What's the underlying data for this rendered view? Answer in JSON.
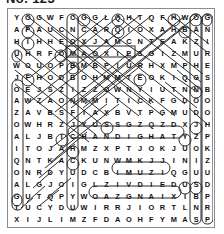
{
  "header": {
    "title": "No. 123"
  },
  "puzzle": {
    "name": "word-search-grid",
    "rows": 18,
    "cols": 18,
    "grid": [
      [
        "Y",
        "O",
        "G",
        "W",
        "F",
        "C",
        "G",
        "G",
        "L",
        "Q",
        "H",
        "T",
        "Q",
        "F",
        "H",
        "W",
        "O",
        "G"
      ],
      [
        "A",
        "P",
        "A",
        "U",
        "C",
        "N",
        "C",
        "A",
        "R",
        "Q",
        "I",
        "O",
        "X",
        "A",
        "H",
        "B",
        "A",
        "N"
      ],
      [
        "H",
        "I",
        "H",
        "H",
        "E",
        "O",
        "X",
        "J",
        "A",
        "M",
        "C",
        "N",
        "T",
        "E",
        "A",
        "K",
        "Z",
        "I"
      ],
      [
        "U",
        "H",
        "R",
        "F",
        "O",
        "M",
        "A",
        "O",
        "X",
        "I",
        "E",
        "S",
        "G",
        "I",
        "Z",
        "M",
        "U",
        "R"
      ],
      [
        "W",
        "O",
        "U",
        "O",
        "P",
        "B",
        "M",
        "B",
        "P",
        "I",
        "U",
        "R",
        "H",
        "X",
        "M",
        "P",
        "H",
        "E"
      ],
      [
        "J",
        "F",
        "H",
        "O",
        "D",
        "B",
        "O",
        "H",
        "M",
        "M",
        "T",
        "E",
        "O",
        "K",
        "I",
        "Q",
        "G",
        "S"
      ],
      [
        "O",
        "E",
        "J",
        "S",
        "Z",
        "I",
        "Z",
        "Z",
        "O",
        "W",
        "N",
        "Y",
        "I",
        "U",
        "T",
        "N",
        "N",
        "B"
      ],
      [
        "A",
        "W",
        "Z",
        "A",
        "O",
        "N",
        "M",
        "M",
        "I",
        "T",
        "I",
        "C",
        "K",
        "F",
        "G",
        "D",
        "O",
        "O"
      ],
      [
        "Z",
        "A",
        "V",
        "B",
        "S",
        "F",
        "I",
        "A",
        "X",
        "B",
        "V",
        "T",
        "P",
        "G",
        "M",
        "U",
        "D",
        "O"
      ],
      [
        "O",
        "W",
        "H",
        "R",
        "Z",
        "J",
        "Y",
        "U",
        "S",
        "S",
        "G",
        "Z",
        "Q",
        "Z",
        "D",
        "X",
        "J",
        "H"
      ],
      [
        "A",
        "L",
        "J",
        "B",
        "I",
        "C",
        "H",
        "A",
        "N",
        "D",
        "I",
        "G",
        "H",
        "A",
        "T",
        "Y",
        "Z",
        "P"
      ],
      [
        "I",
        "T",
        "O",
        "J",
        "A",
        "H",
        "M",
        "Z",
        "X",
        "P",
        "T",
        "J",
        "O",
        "K",
        "J",
        "U",
        "O",
        "K"
      ],
      [
        "Q",
        "N",
        "T",
        "K",
        "A",
        "C",
        "K",
        "U",
        "N",
        "W",
        "M",
        "K",
        "J",
        "J",
        "I",
        "N",
        "I",
        "Z"
      ],
      [
        "O",
        "N",
        "R",
        "D",
        "Y",
        "U",
        "D",
        "C",
        "B",
        "I",
        "M",
        "U",
        "Z",
        "I",
        "Q",
        "G",
        "U",
        "U"
      ],
      [
        "A",
        "L",
        "G",
        "J",
        "O",
        "I",
        "G",
        "L",
        "Z",
        "I",
        "V",
        "D",
        "I",
        "E",
        "D",
        "U",
        "S",
        "D"
      ],
      [
        "G",
        "U",
        "T",
        "Q",
        "P",
        "Y",
        "W",
        "O",
        "A",
        "Z",
        "G",
        "N",
        "A",
        "I",
        "X",
        "I",
        "B",
        "P"
      ],
      [
        "T",
        "U",
        "C",
        "Y",
        "D",
        "U",
        "W",
        "I",
        "R",
        "R",
        "J",
        "I",
        "O",
        "R",
        "T",
        "L",
        "N",
        "R"
      ],
      [
        "X",
        "I",
        "J",
        "L",
        "I",
        "M",
        "Z",
        "F",
        "D",
        "A",
        "O",
        "H",
        "F",
        "Y",
        "M",
        "A",
        "S",
        "P"
      ]
    ],
    "found_words": [
      {
        "text": "CHANDIGHAT",
        "row": 10,
        "col_start": 5,
        "col_end": 14,
        "shape": "capsule-horizontal"
      },
      {
        "text": "IMUZI",
        "row": 13,
        "col_start": 9,
        "col_end": 13,
        "shape": "capsule-horizontal"
      },
      {
        "text": "OAZGNAIX",
        "row": 15,
        "col_start": 7,
        "col_end": 14,
        "shape": "capsule-horizontal"
      },
      {
        "text": "MAOXIE",
        "row": 3,
        "col_start": 5,
        "col_end": 10,
        "shape": "box-horizontal"
      },
      {
        "text": "OAZUHGNODJYOIUSBNS",
        "col": 16,
        "row_start": 0,
        "row_end": 17,
        "shape": "capsule-vertical"
      },
      {
        "text": "GNIRESBOOHPKZUDPRP",
        "col": 17,
        "row_start": 0,
        "row_end": 17,
        "shape": "capsule-vertical"
      },
      {
        "text": "OAZOAIQOAGT",
        "col": 0,
        "row_start": 6,
        "row_end": 16,
        "shape": "capsule-vertical"
      },
      {
        "text": "HOBSANKDYUW",
        "col": 5,
        "row_start": 0,
        "row_end": 16,
        "shape": "capsule-vertical"
      }
    ],
    "circled_letters": [
      {
        "letter": "O",
        "row": 0,
        "col": 1
      },
      {
        "letter": "G",
        "row": 0,
        "col": 6
      },
      {
        "letter": "Q",
        "row": 0,
        "col": 9
      },
      {
        "letter": "H",
        "row": 0,
        "col": 14
      },
      {
        "letter": "O",
        "row": 0,
        "col": 16
      },
      {
        "letter": "G",
        "row": 0,
        "col": 17
      },
      {
        "letter": "P",
        "row": 1,
        "col": 1
      },
      {
        "letter": "Q",
        "row": 1,
        "col": 9
      },
      {
        "letter": "B",
        "row": 1,
        "col": 15
      },
      {
        "letter": "I",
        "row": 2,
        "col": 1
      },
      {
        "letter": "U",
        "row": 3,
        "col": 0
      },
      {
        "letter": "O",
        "row": 3,
        "col": 4
      },
      {
        "letter": "F",
        "row": 5,
        "col": 1
      },
      {
        "letter": "E",
        "row": 5,
        "col": 11
      },
      {
        "letter": "B",
        "row": 4,
        "col": 5
      },
      {
        "letter": "N",
        "row": 6,
        "col": 16
      },
      {
        "letter": "S",
        "row": 9,
        "col": 8
      },
      {
        "letter": "J",
        "row": 9,
        "col": 16
      },
      {
        "letter": "I",
        "row": 10,
        "col": 4
      },
      {
        "letter": "Y",
        "row": 10,
        "col": 15
      },
      {
        "letter": "H",
        "row": 11,
        "col": 5
      },
      {
        "letter": "C",
        "row": 12,
        "col": 5
      },
      {
        "letter": "I",
        "row": 15,
        "col": 15
      },
      {
        "letter": "B",
        "row": 15,
        "col": 16
      },
      {
        "letter": "T",
        "row": 16,
        "col": 0
      }
    ]
  }
}
